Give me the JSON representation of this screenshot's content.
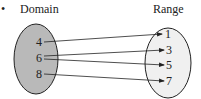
{
  "bullet": "•",
  "domain": {
    "title": "Domain",
    "fill": "#b9b9b9",
    "elements": [
      {
        "label": "4",
        "x": 38,
        "y": 46
      },
      {
        "label": "6",
        "x": 38,
        "y": 62
      },
      {
        "label": "8",
        "x": 38,
        "y": 78
      }
    ]
  },
  "range": {
    "title": "Range",
    "fill": "#f0f0f0",
    "elements": [
      {
        "label": "1",
        "x": 164,
        "y": 38
      },
      {
        "label": "3",
        "x": 166,
        "y": 54
      },
      {
        "label": "5",
        "x": 166,
        "y": 69
      },
      {
        "label": "7",
        "x": 166,
        "y": 85
      }
    ]
  },
  "mapping": [
    {
      "from": "4",
      "to": "1"
    },
    {
      "from": "6",
      "to": "3"
    },
    {
      "from": "6",
      "to": "5"
    },
    {
      "from": "8",
      "to": "7"
    }
  ],
  "stroke_color": "#222222"
}
